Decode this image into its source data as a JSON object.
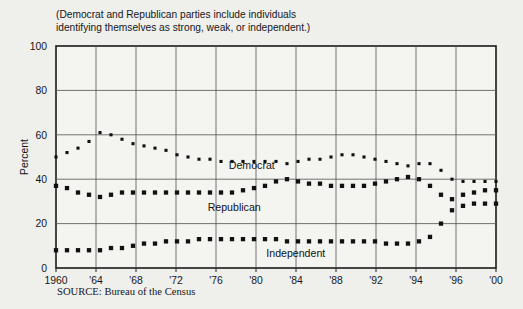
{
  "subtitle": {
    "line1": "(Democrat and Republican parties include individuals",
    "line2": "identifying themselves as strong, weak, or independent.)"
  },
  "source": "SOURCE: Bureau of the Census",
  "chart_data": {
    "type": "line",
    "title": "",
    "subtitle": "(Democrat and Republican parties include individuals identifying themselves as strong, weak, or independent.)",
    "xlabel": "",
    "ylabel": "Percent",
    "ylim": [
      0,
      100
    ],
    "yticks": [
      0,
      20,
      40,
      60,
      80,
      100
    ],
    "ytick_labels": [
      "0",
      "20",
      "40",
      "60",
      "80",
      "100"
    ],
    "categories": [
      "1960",
      "'64",
      "'68",
      "'72",
      "'76",
      "'80",
      "'84",
      "'88",
      "'92",
      "'94",
      "'96",
      "'00"
    ],
    "xtick_labels": [
      "1960",
      "'64",
      "'68",
      "'72",
      "'76",
      "'80",
      "'84",
      "'88",
      "'92",
      "'94",
      "'96",
      "'00"
    ],
    "grid": true,
    "grid_axis": "both",
    "legend": "inline-annotations",
    "marker_style": "square-dotted",
    "series": [
      {
        "name": "Democrat",
        "label": "Democrat",
        "color": "#111111",
        "x": [
          "1960",
          "1961",
          "1962",
          "1963",
          "'64",
          "1965",
          "1966",
          "1967",
          "'68",
          "1969",
          "1970",
          "1971",
          "'72",
          "1973",
          "1974",
          "1975",
          "'76",
          "1977",
          "1978",
          "1979",
          "'80",
          "1981",
          "1982",
          "1983",
          "'84",
          "1985",
          "1986",
          "1987",
          "'88",
          "1989",
          "1990",
          "1991",
          "'92",
          "1993",
          "'94",
          "1995",
          "'96",
          "1997",
          "1998",
          "1999",
          "'00"
        ],
        "values": [
          50,
          52,
          54,
          57,
          61,
          60,
          58,
          56,
          55,
          54,
          53,
          51,
          50,
          49,
          49,
          48,
          48,
          48,
          48,
          48,
          48,
          47,
          48,
          49,
          49,
          50,
          51,
          51,
          50,
          49,
          48,
          47,
          46,
          47,
          47,
          44,
          40,
          39,
          39,
          39,
          39
        ]
      },
      {
        "name": "Republican",
        "label": "Republican",
        "color": "#111111",
        "x": [
          "1960",
          "1961",
          "1962",
          "1963",
          "'64",
          "1965",
          "1966",
          "1967",
          "'68",
          "1969",
          "1970",
          "1971",
          "'72",
          "1973",
          "1974",
          "1975",
          "'76",
          "1977",
          "1978",
          "1979",
          "'80",
          "1981",
          "1982",
          "1983",
          "'84",
          "1985",
          "1986",
          "1987",
          "'88",
          "1989",
          "1990",
          "1991",
          "'92",
          "1993",
          "'94",
          "1995",
          "'96",
          "1997",
          "1998",
          "1999",
          "'00"
        ],
        "values": [
          37,
          36,
          34,
          33,
          32,
          33,
          34,
          34,
          34,
          34,
          34,
          34,
          34,
          34,
          34,
          34,
          34,
          35,
          36,
          37,
          39,
          40,
          39,
          38,
          38,
          37,
          37,
          37,
          37,
          38,
          39,
          40,
          41,
          40,
          37,
          33,
          31,
          33,
          34,
          35,
          35
        ]
      },
      {
        "name": "Independent",
        "label": "Independent",
        "color": "#111111",
        "x": [
          "1960",
          "1961",
          "1962",
          "1963",
          "'64",
          "1965",
          "1966",
          "1967",
          "'68",
          "1969",
          "1970",
          "1971",
          "'72",
          "1973",
          "1974",
          "1975",
          "'76",
          "1977",
          "1978",
          "1979",
          "'80",
          "1981",
          "1982",
          "1983",
          "'84",
          "1985",
          "1986",
          "1987",
          "'88",
          "1989",
          "1990",
          "1991",
          "'92",
          "1993",
          "'94",
          "1995",
          "'96",
          "1997",
          "1998",
          "1999",
          "'00"
        ],
        "values": [
          8,
          8,
          8,
          8,
          8,
          9,
          9,
          10,
          11,
          11,
          12,
          12,
          12,
          13,
          13,
          13,
          13,
          13,
          13,
          13,
          13,
          12,
          12,
          12,
          12,
          12,
          12,
          12,
          12,
          12,
          11,
          11,
          11,
          12,
          14,
          20,
          26,
          28,
          29,
          29,
          29
        ]
      }
    ],
    "annotations": [
      {
        "text": "Democrat",
        "x_frac": 0.445,
        "value": 44.5
      },
      {
        "text": "Republican",
        "x_frac": 0.405,
        "value": 25.5
      },
      {
        "text": "Independent",
        "x_frac": 0.545,
        "value": 5.0
      }
    ]
  }
}
